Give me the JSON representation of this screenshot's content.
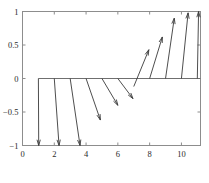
{
  "chart_data": {
    "type": "scatter",
    "subtype": "quiver",
    "title": "",
    "subtitle": "",
    "xlabel": "",
    "ylabel": "",
    "xlim": [
      0,
      11.2
    ],
    "ylim": [
      -1,
      1
    ],
    "xticks": [
      0,
      2,
      4,
      6,
      8,
      10
    ],
    "yticks": [
      -1,
      -0.5,
      0,
      0.5,
      1
    ],
    "xticklabels": [
      "0",
      "2",
      "4",
      "6",
      "8",
      "10"
    ],
    "yticklabels": [
      "-1",
      "-0.5",
      "0",
      "0.5",
      "1"
    ],
    "grid": false,
    "legend": null,
    "box": true,
    "series": [
      {
        "name": "vector-field",
        "kind": "quiver",
        "color": "#3a3a3a",
        "baseline_y": 0,
        "baseline_x_range": [
          1,
          11.2
        ],
        "vectors": [
          {
            "x": 1.0,
            "y": 0,
            "u": 0.02,
            "v": -1.0
          },
          {
            "x": 2.0,
            "y": 0,
            "u": 0.3,
            "v": -1.0
          },
          {
            "x": 3.0,
            "y": 0,
            "u": 0.62,
            "v": -1.0
          },
          {
            "x": 4.0,
            "y": 0,
            "u": 0.9,
            "v": -0.62
          },
          {
            "x": 5.0,
            "y": 0,
            "u": 1.0,
            "v": -0.4
          },
          {
            "x": 6.0,
            "y": 0,
            "u": 0.95,
            "v": -0.3
          },
          {
            "x": 7.0,
            "y": -0.12,
            "u": 0.95,
            "v": 0.55
          },
          {
            "x": 8.0,
            "y": 0,
            "u": 0.8,
            "v": 0.62
          },
          {
            "x": 9.0,
            "y": 0,
            "u": 0.55,
            "v": 0.9
          },
          {
            "x": 10.0,
            "y": 0,
            "u": 0.42,
            "v": 0.98
          },
          {
            "x": 11.0,
            "y": 0,
            "u": 0.08,
            "v": 1.0
          }
        ]
      }
    ],
    "annotations": []
  },
  "axes": {
    "frame_color": "#8d8d8d",
    "line_color": "#6f6f6f",
    "arrow_color": "#3a3a3a"
  },
  "caption": {
    "text": ""
  }
}
